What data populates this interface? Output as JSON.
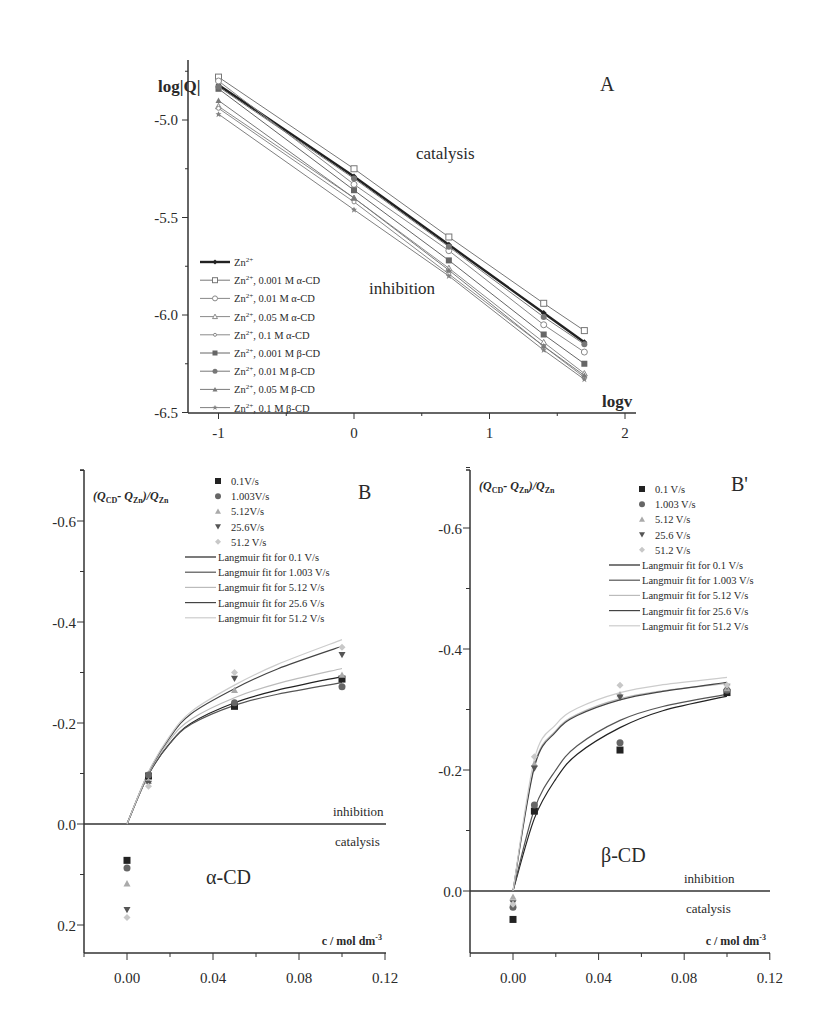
{
  "chart_data": [
    {
      "id": "A",
      "type": "line",
      "panel_label": "A",
      "title": "",
      "xlabel": "logv",
      "ylabel": "log|Q|",
      "xlim": [
        -1.2,
        2.2
      ],
      "ylim": [
        -6.5,
        -4.72
      ],
      "xticks": [
        "-1",
        "0",
        "1",
        "2"
      ],
      "yticks": [
        "-5.0",
        "-5.5",
        "-6.0",
        "-6.5"
      ],
      "grid": false,
      "legend_position": "lower-left",
      "annotations": [
        "catalysis",
        "inhibition"
      ],
      "x": [
        -1.0,
        0.0,
        0.7,
        1.4,
        1.7
      ],
      "series": [
        {
          "name": "Zn2+",
          "marker": "filled-diamond",
          "color": "#222222",
          "width": 2.4,
          "values": [
            -4.82,
            -5.29,
            -5.64,
            -5.99,
            -6.14
          ]
        },
        {
          "name": "Zn2+, 0.001 M α-CD",
          "marker": "open-square",
          "color": "#777777",
          "width": 1,
          "values": [
            -4.78,
            -5.25,
            -5.6,
            -5.94,
            -6.08
          ]
        },
        {
          "name": "Zn2+, 0.01 M α-CD",
          "marker": "open-circle",
          "color": "#888888",
          "width": 1,
          "values": [
            -4.8,
            -5.33,
            -5.67,
            -6.05,
            -6.19
          ]
        },
        {
          "name": "Zn2+, 0.05 M α-CD",
          "marker": "open-triangle",
          "color": "#8a8a8a",
          "width": 1,
          "values": [
            -4.93,
            -5.4,
            -5.76,
            -6.14,
            -6.3
          ]
        },
        {
          "name": "Zn2+, 0.1 M α-CD",
          "marker": "open-circle-small",
          "color": "#8a8a8a",
          "width": 1,
          "values": [
            -4.94,
            -5.42,
            -5.79,
            -6.16,
            -6.32
          ]
        },
        {
          "name": "Zn2+, 0.001 M β-CD",
          "marker": "filled-square",
          "color": "#666666",
          "width": 1,
          "values": [
            -4.84,
            -5.36,
            -5.72,
            -6.1,
            -6.25
          ]
        },
        {
          "name": "Zn2+, 0.01 M β-CD",
          "marker": "filled-circle",
          "color": "#777777",
          "width": 1,
          "values": [
            -4.83,
            -5.3,
            -5.65,
            -6.01,
            -6.15
          ]
        },
        {
          "name": "Zn2+, 0.05 M β-CD",
          "marker": "filled-triangle",
          "color": "#7a7a7a",
          "width": 1,
          "values": [
            -4.9,
            -5.4,
            -5.77,
            -6.16,
            -6.31
          ]
        },
        {
          "name": "Zn2+, 0.1 M β-CD",
          "marker": "filled-star",
          "color": "#808080",
          "width": 1,
          "values": [
            -4.97,
            -5.46,
            -5.8,
            -6.18,
            -6.33
          ]
        }
      ]
    },
    {
      "id": "B",
      "type": "scatter",
      "panel_label": "B",
      "subtitle": "α-CD",
      "xlabel": "c / mol dm-3",
      "ylabel": "(QCD - QZn)/QZn",
      "xlim": [
        -0.02,
        0.12
      ],
      "ylim": [
        0.25,
        -0.72
      ],
      "y_inverted": true,
      "xticks": [
        "0.00",
        "0.04",
        "0.08",
        "0.12"
      ],
      "yticks": [
        "-0.6",
        "-0.4",
        "-0.2",
        "0.0",
        "0.2"
      ],
      "grid": false,
      "legend_position": "upper-right",
      "annotations": [
        "inhibition",
        "catalysis"
      ],
      "x": [
        0.0,
        0.01,
        0.05,
        0.1
      ],
      "series": [
        {
          "name": "0.1V/s",
          "marker": "square",
          "color": "#222222",
          "values": [
            0.072,
            -0.095,
            -0.233,
            -0.287
          ]
        },
        {
          "name": "1.003V/s",
          "marker": "circle",
          "color": "#666666",
          "values": [
            0.087,
            -0.097,
            -0.24,
            -0.272
          ]
        },
        {
          "name": "5.12V/s",
          "marker": "triangle-up",
          "color": "#aaaaaa",
          "values": [
            0.118,
            -0.085,
            -0.265,
            -0.295
          ]
        },
        {
          "name": "25.6V/s",
          "marker": "triangle-down",
          "color": "#555555",
          "values": [
            0.17,
            -0.08,
            -0.288,
            -0.335
          ]
        },
        {
          "name": "51.2 V/s",
          "marker": "diamond",
          "color": "#c8c8c8",
          "values": [
            0.185,
            -0.075,
            -0.3,
            -0.35
          ]
        }
      ],
      "fits": [
        {
          "name": "Langmuir fit for 0.1 V/s",
          "color": "#222222",
          "x0": 0.0,
          "points": [
            [
              0.0,
              0.0
            ],
            [
              0.01,
              -0.098
            ],
            [
              0.02,
              -0.16
            ],
            [
              0.03,
              -0.2
            ],
            [
              0.05,
              -0.24
            ],
            [
              0.07,
              -0.265
            ],
            [
              0.1,
              -0.292
            ]
          ]
        },
        {
          "name": "Langmuir fit for 1.003 V/s",
          "color": "#555555",
          "points": [
            [
              0.0,
              0.0
            ],
            [
              0.01,
              -0.098
            ],
            [
              0.02,
              -0.16
            ],
            [
              0.03,
              -0.198
            ],
            [
              0.05,
              -0.235
            ],
            [
              0.07,
              -0.257
            ],
            [
              0.1,
              -0.28
            ]
          ]
        },
        {
          "name": "Langmuir fit for 5.12 V/s",
          "color": "#bbbbbb",
          "points": [
            [
              0.0,
              0.0
            ],
            [
              0.01,
              -0.1
            ],
            [
              0.02,
              -0.167
            ],
            [
              0.03,
              -0.208
            ],
            [
              0.05,
              -0.25
            ],
            [
              0.07,
              -0.278
            ],
            [
              0.1,
              -0.308
            ]
          ]
        },
        {
          "name": "Langmuir fit for 25.6 V/s",
          "color": "#444444",
          "points": [
            [
              0.0,
              0.0
            ],
            [
              0.01,
              -0.102
            ],
            [
              0.02,
              -0.172
            ],
            [
              0.03,
              -0.219
            ],
            [
              0.05,
              -0.268
            ],
            [
              0.07,
              -0.307
            ],
            [
              0.1,
              -0.352
            ]
          ]
        },
        {
          "name": "Langmuir fit for 51.2 V/s",
          "color": "#cccccc",
          "points": [
            [
              0.0,
              0.0
            ],
            [
              0.01,
              -0.103
            ],
            [
              0.02,
              -0.175
            ],
            [
              0.03,
              -0.223
            ],
            [
              0.05,
              -0.275
            ],
            [
              0.07,
              -0.316
            ],
            [
              0.1,
              -0.365
            ]
          ]
        }
      ]
    },
    {
      "id": "B'",
      "type": "scatter",
      "panel_label": "B'",
      "subtitle": "β-CD",
      "xlabel": "c / mol dm-3",
      "ylabel": "(QCD - QZn)/QZn",
      "xlim": [
        -0.02,
        0.12
      ],
      "ylim": [
        0.1,
        -0.72
      ],
      "y_inverted": true,
      "xticks": [
        "0.00",
        "0.04",
        "0.08",
        "0.12"
      ],
      "yticks": [
        "-0.6",
        "-0.4",
        "-0.2",
        "0.0"
      ],
      "grid": false,
      "legend_position": "upper-right",
      "annotations": [
        "inhibition",
        "catalysis"
      ],
      "x": [
        0.0,
        0.01,
        0.05,
        0.1
      ],
      "series": [
        {
          "name": "0.1 V/s",
          "marker": "square",
          "color": "#222222",
          "values": [
            0.047,
            -0.132,
            -0.233,
            -0.328
          ]
        },
        {
          "name": "1.003 V/s",
          "marker": "circle",
          "color": "#666666",
          "values": [
            0.027,
            -0.142,
            -0.245,
            -0.332
          ]
        },
        {
          "name": "5.12 V/s",
          "marker": "triangle-up",
          "color": "#aaaaaa",
          "values": [
            0.01,
            -0.21,
            -0.325,
            -0.335
          ]
        },
        {
          "name": "25.6 V/s",
          "marker": "triangle-down",
          "color": "#555555",
          "values": [
            0.02,
            -0.203,
            -0.32,
            -0.338
          ]
        },
        {
          "name": "51.2 V/s",
          "marker": "diamond",
          "color": "#c8c8c8",
          "values": [
            0.022,
            -0.222,
            -0.34,
            -0.34
          ]
        }
      ],
      "fits": [
        {
          "name": "Langmuir fit for 0.1 V/s",
          "color": "#222222",
          "points": [
            [
              0.0,
              0.0
            ],
            [
              0.01,
              -0.12
            ],
            [
              0.02,
              -0.185
            ],
            [
              0.03,
              -0.226
            ],
            [
              0.05,
              -0.27
            ],
            [
              0.07,
              -0.298
            ],
            [
              0.1,
              -0.322
            ]
          ]
        },
        {
          "name": "Langmuir fit for 1.003 V/s",
          "color": "#555555",
          "points": [
            [
              0.0,
              0.0
            ],
            [
              0.01,
              -0.135
            ],
            [
              0.02,
              -0.2
            ],
            [
              0.03,
              -0.24
            ],
            [
              0.05,
              -0.282
            ],
            [
              0.07,
              -0.305
            ],
            [
              0.1,
              -0.325
            ]
          ]
        },
        {
          "name": "Langmuir fit for 5.12 V/s",
          "color": "#bbbbbb",
          "points": [
            [
              0.0,
              0.0
            ],
            [
              0.01,
              -0.208
            ],
            [
              0.02,
              -0.265
            ],
            [
              0.03,
              -0.292
            ],
            [
              0.05,
              -0.318
            ],
            [
              0.07,
              -0.331
            ],
            [
              0.1,
              -0.343
            ]
          ]
        },
        {
          "name": "Langmuir fit for 25.6 V/s",
          "color": "#444444",
          "points": [
            [
              0.0,
              0.0
            ],
            [
              0.01,
              -0.205
            ],
            [
              0.02,
              -0.263
            ],
            [
              0.03,
              -0.29
            ],
            [
              0.05,
              -0.316
            ],
            [
              0.07,
              -0.33
            ],
            [
              0.1,
              -0.345
            ]
          ]
        },
        {
          "name": "Langmuir fit for 51.2 V/s",
          "color": "#cccccc",
          "points": [
            [
              0.0,
              0.0
            ],
            [
              0.01,
              -0.218
            ],
            [
              0.02,
              -0.275
            ],
            [
              0.03,
              -0.302
            ],
            [
              0.05,
              -0.328
            ],
            [
              0.07,
              -0.341
            ],
            [
              0.1,
              -0.353
            ]
          ]
        }
      ]
    }
  ],
  "labels": {
    "A": {
      "panel": "A",
      "ylabel_main": "log|Q|",
      "xlabel_main": "logv",
      "catalysis": "catalysis",
      "inhibition": "inhibition"
    },
    "B": {
      "panel": "B",
      "subtitle": "α-CD",
      "inhibition": "inhibition",
      "catalysis": "catalysis",
      "xlabel": "c / mol dm",
      "xlabel_sup": "-3"
    },
    "Bp": {
      "panel": "B'",
      "subtitle": "β-CD",
      "inhibition": "inhibition",
      "catalysis": "catalysis",
      "xlabel": "c / mol dm",
      "xlabel_sup": "-3"
    }
  }
}
